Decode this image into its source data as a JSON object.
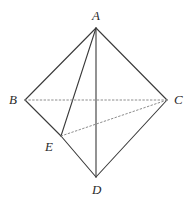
{
  "figure": {
    "name": "tetrahedron-abcde-diagram",
    "width": 190,
    "height": 201,
    "background_color": "#ffffff",
    "solid_line_color": "#3a3a3a",
    "dashed_line_color": "#8c8c8c",
    "label_color": "#2b2b2b",
    "solid_line_width": 1.1,
    "dashed_line_width": 1,
    "dash_pattern": "1.6 2.2"
  },
  "vertices": [
    {
      "id": "A",
      "label": "A",
      "x": 96,
      "y": 28,
      "label_x": 92,
      "label_y": 9
    },
    {
      "id": "B",
      "label": "B",
      "x": 25,
      "y": 100,
      "label_x": 9,
      "label_y": 93
    },
    {
      "id": "C",
      "label": "C",
      "x": 167,
      "y": 100,
      "label_x": 174,
      "label_y": 93
    },
    {
      "id": "D",
      "label": "D",
      "x": 96,
      "y": 177,
      "label_x": 92,
      "label_y": 183
    },
    {
      "id": "E",
      "label": "E",
      "x": 61,
      "y": 136,
      "label_x": 45,
      "label_y": 140
    }
  ],
  "edges": [
    {
      "id": "AB",
      "from": "A",
      "to": "B",
      "style": "solid",
      "x1": 96,
      "y1": 28,
      "x2": 25,
      "y2": 100
    },
    {
      "id": "AC",
      "from": "A",
      "to": "C",
      "style": "solid",
      "x1": 96,
      "y1": 28,
      "x2": 167,
      "y2": 100
    },
    {
      "id": "AE",
      "from": "A",
      "to": "E",
      "style": "solid",
      "x1": 96,
      "y1": 28,
      "x2": 61,
      "y2": 136
    },
    {
      "id": "AD",
      "from": "A",
      "to": "D",
      "style": "solid",
      "x1": 96,
      "y1": 28,
      "x2": 96,
      "y2": 177
    },
    {
      "id": "BE",
      "from": "B",
      "to": "E",
      "style": "solid",
      "x1": 25,
      "y1": 100,
      "x2": 61,
      "y2": 136
    },
    {
      "id": "ED",
      "from": "E",
      "to": "D",
      "style": "solid",
      "x1": 61,
      "y1": 136,
      "x2": 96,
      "y2": 177
    },
    {
      "id": "DC",
      "from": "D",
      "to": "C",
      "style": "solid",
      "x1": 96,
      "y1": 177,
      "x2": 167,
      "y2": 100
    },
    {
      "id": "BC",
      "from": "B",
      "to": "C",
      "style": "dashed",
      "x1": 25,
      "y1": 100,
      "x2": 167,
      "y2": 100
    },
    {
      "id": "EC",
      "from": "E",
      "to": "C",
      "style": "dashed",
      "x1": 61,
      "y1": 136,
      "x2": 167,
      "y2": 100
    }
  ]
}
